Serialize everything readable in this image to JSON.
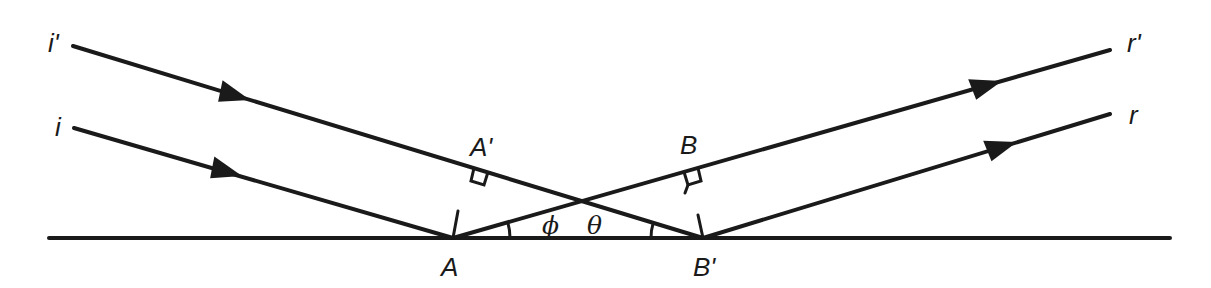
{
  "diagram": {
    "labels": {
      "incident_outer": "i'",
      "incident_inner": "i",
      "reflected_outer": "r'",
      "reflected_inner": "r",
      "point_a_prime": "A'",
      "point_b": "B",
      "point_a": "A",
      "point_b_prime": "B'",
      "angle_reflection": "ϕ",
      "angle_incidence": "θ"
    },
    "colors": {
      "ink": "#1a1a1a",
      "background": "#ffffff"
    },
    "geometry": {
      "surface": {
        "x1": 49,
        "y1": 238,
        "x2": 1170,
        "y2": 238
      },
      "ray_i_prime": {
        "from": [
          73,
          46
        ],
        "to": [
          703,
          238
        ]
      },
      "ray_i": {
        "from": [
          74,
          128
        ],
        "to": [
          453,
          238
        ]
      },
      "ray_r_prime": {
        "from": [
          453,
          238
        ],
        "to": [
          1110,
          50
        ]
      },
      "ray_r": {
        "from": [
          703,
          238
        ],
        "to": [
          1110,
          114
        ]
      },
      "point_A": [
        453,
        238
      ],
      "point_B_prime": [
        703,
        238
      ],
      "foot_A_prime": [
        474,
        168
      ],
      "foot_B": [
        684,
        172
      ]
    }
  }
}
